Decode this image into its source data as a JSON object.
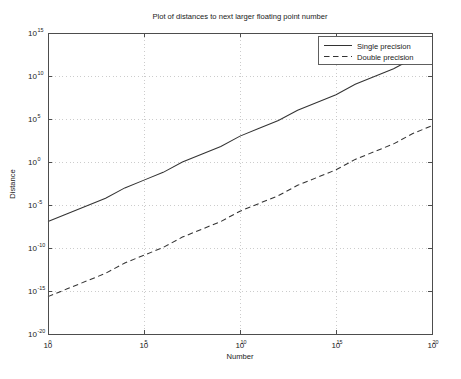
{
  "chart_data": {
    "type": "line",
    "title": "Plot of distances to next larger floating point number",
    "xlabel": "Number",
    "ylabel": "Distance",
    "xscale": "log",
    "yscale": "log",
    "xlim": [
      1.0,
      1e+20
    ],
    "ylim": [
      1e-20,
      1000000000000000.0
    ],
    "grid": true,
    "legend_position": "top-right",
    "xticks": [
      {
        "base": "10",
        "exp": "0"
      },
      {
        "base": "10",
        "exp": "5"
      },
      {
        "base": "10",
        "exp": "10"
      },
      {
        "base": "10",
        "exp": "15"
      },
      {
        "base": "10",
        "exp": "20"
      }
    ],
    "yticks": [
      {
        "base": "10",
        "exp": "15"
      },
      {
        "base": "10",
        "exp": "10"
      },
      {
        "base": "10",
        "exp": "5"
      },
      {
        "base": "10",
        "exp": "0"
      },
      {
        "base": "10",
        "exp": "-5"
      },
      {
        "base": "10",
        "exp": "-10"
      },
      {
        "base": "10",
        "exp": "-15"
      },
      {
        "base": "10",
        "exp": "-20"
      }
    ],
    "series": [
      {
        "name": "Single precision",
        "style": "solid",
        "color": "#333333",
        "x": [
          1.0,
          10.0,
          100.0,
          1000.0,
          10000.0,
          100000.0,
          1000000.0,
          10000000.0,
          100000000.0,
          1000000000.0,
          10000000000.0,
          100000000000.0,
          1000000000000.0,
          10000000000000.0,
          100000000000000.0,
          1000000000000000.0,
          1e+16,
          1e+17,
          1e+18,
          1e+19,
          1e+20
        ],
        "y": [
          1.19e-07,
          9.54e-07,
          7.63e-06,
          6.1e-05,
          0.000977,
          0.00781,
          0.0625,
          1.0,
          8.0,
          64.0,
          1024.0,
          8192.0,
          65536.0,
          1050000.0,
          8390000.0,
          67100000.0,
          1070000000.0,
          8590000000.0,
          68700000000.0,
          1100000000000.0,
          8800000000000.0
        ]
      },
      {
        "name": "Double precision",
        "style": "dashed",
        "color": "#333333",
        "x": [
          1.0,
          10.0,
          100.0,
          1000.0,
          10000.0,
          100000.0,
          1000000.0,
          10000000.0,
          100000000.0,
          1000000000.0,
          10000000000.0,
          100000000000.0,
          1000000000000.0,
          10000000000000.0,
          100000000000000.0,
          1000000000000000.0,
          1e+16,
          1e+17,
          1e+18,
          1e+19,
          1e+20
        ],
        "y": [
          2.22e-16,
          1.78e-15,
          1.42e-14,
          1.14e-13,
          1.82e-12,
          1.46e-11,
          1.16e-10,
          1.86e-09,
          1.49e-08,
          1.19e-07,
          1.91e-06,
          1.53e-05,
          0.000122,
          0.00195,
          0.0156,
          0.125,
          2.0,
          16.0,
          128.0,
          2048.0,
          16384.0
        ]
      }
    ],
    "legend_entries": [
      {
        "label": "Single precision",
        "style": "solid"
      },
      {
        "label": "Double precision",
        "style": "dashed"
      }
    ]
  }
}
